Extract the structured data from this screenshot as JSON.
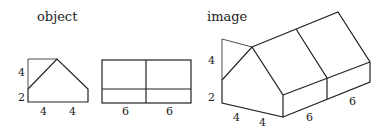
{
  "titles": {
    "object": "object",
    "image": "image"
  },
  "front_view": {
    "labels": {
      "upper_height": "4",
      "lower_height": "2",
      "left_width": "4",
      "right_width": "4"
    }
  },
  "side_view": {
    "labels": {
      "left_width": "6",
      "right_width": "6"
    }
  },
  "isometric_view": {
    "labels": {
      "upper_height": "4",
      "lower_height": "2",
      "width_a": "4",
      "width_b": "4",
      "depth_a": "6",
      "depth_b": "6"
    }
  },
  "colors": {
    "stroke": "#222222",
    "background": "#ffffff"
  }
}
